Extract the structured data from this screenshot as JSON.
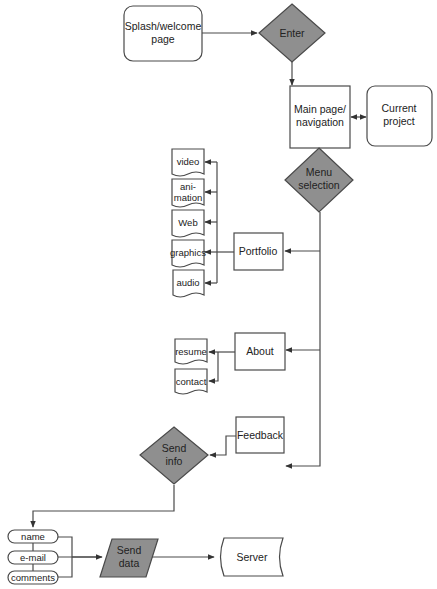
{
  "diagram": {
    "type": "flowchart",
    "nodes": {
      "splash": {
        "label_lines": [
          "Splash/welcome",
          "page"
        ],
        "shape": "rounded-rectangle"
      },
      "enter": {
        "label_lines": [
          "Enter"
        ],
        "shape": "decision",
        "fill": "#8f8f8f"
      },
      "main_page": {
        "label_lines": [
          "Main page/",
          "navigation"
        ],
        "shape": "rectangle"
      },
      "current_project": {
        "label_lines": [
          "Current",
          "project"
        ],
        "shape": "rounded-rectangle"
      },
      "menu_selection": {
        "label_lines": [
          "Menu",
          "selection"
        ],
        "shape": "decision",
        "fill": "#8f8f8f"
      },
      "portfolio": {
        "label_lines": [
          "Portfolio"
        ],
        "shape": "rectangle"
      },
      "video": {
        "label_lines": [
          "video"
        ],
        "shape": "document"
      },
      "animation": {
        "label_lines": [
          "ani-",
          "mation"
        ],
        "shape": "document"
      },
      "web": {
        "label_lines": [
          "Web"
        ],
        "shape": "document"
      },
      "graphics": {
        "label_lines": [
          "graphics"
        ],
        "shape": "document"
      },
      "audio": {
        "label_lines": [
          "audio"
        ],
        "shape": "document"
      },
      "about": {
        "label_lines": [
          "About"
        ],
        "shape": "rectangle"
      },
      "resume": {
        "label_lines": [
          "resume"
        ],
        "shape": "document"
      },
      "contact": {
        "label_lines": [
          "contact"
        ],
        "shape": "document"
      },
      "feedback": {
        "label_lines": [
          "Feedback"
        ],
        "shape": "rectangle"
      },
      "send_info": {
        "label_lines": [
          "Send",
          "info"
        ],
        "shape": "decision",
        "fill": "#8f8f8f"
      },
      "name": {
        "label_lines": [
          "name"
        ],
        "shape": "terminator"
      },
      "email": {
        "label_lines": [
          "e-mail"
        ],
        "shape": "terminator"
      },
      "comments": {
        "label_lines": [
          "comments"
        ],
        "shape": "terminator"
      },
      "send_data": {
        "label_lines": [
          "Send",
          "data"
        ],
        "shape": "data-parallelogram",
        "fill": "#8f8f8f"
      },
      "server": {
        "label_lines": [
          "Server"
        ],
        "shape": "stored-data"
      }
    },
    "edges": [
      {
        "from": "splash",
        "to": "enter"
      },
      {
        "from": "enter",
        "to": "main_page"
      },
      {
        "from": "main_page",
        "to": "current_project",
        "bidirectional": true
      },
      {
        "from": "main_page",
        "to": "menu_selection"
      },
      {
        "from": "menu_selection",
        "to": "portfolio"
      },
      {
        "from": "menu_selection",
        "to": "about"
      },
      {
        "from": "menu_selection",
        "to": "feedback"
      },
      {
        "from": "portfolio",
        "to": "video"
      },
      {
        "from": "portfolio",
        "to": "animation"
      },
      {
        "from": "portfolio",
        "to": "web"
      },
      {
        "from": "portfolio",
        "to": "graphics"
      },
      {
        "from": "portfolio",
        "to": "audio"
      },
      {
        "from": "about",
        "to": "resume"
      },
      {
        "from": "about",
        "to": "contact"
      },
      {
        "from": "feedback",
        "to": "send_info"
      },
      {
        "from": "send_info",
        "to": "name"
      },
      {
        "from": "name",
        "to": "send_data"
      },
      {
        "from": "email",
        "to": "send_data"
      },
      {
        "from": "comments",
        "to": "send_data"
      },
      {
        "from": "send_data",
        "to": "server"
      }
    ]
  }
}
